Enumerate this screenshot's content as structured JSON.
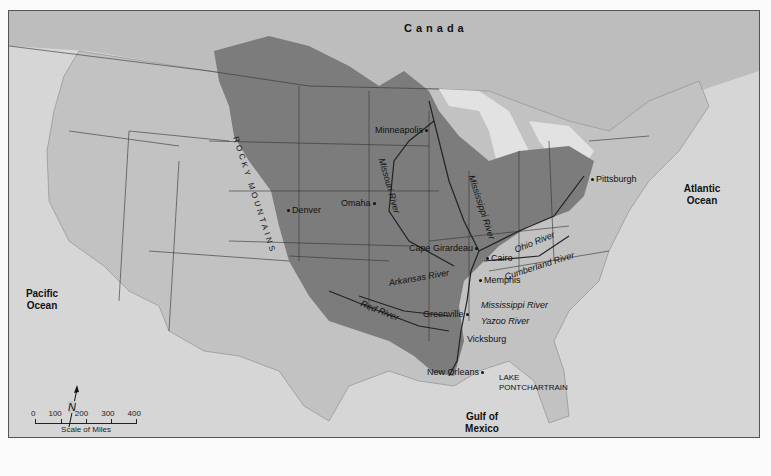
{
  "map": {
    "title_labels": {
      "country": "Canada",
      "oceans": {
        "pacific": "Pacific Ocean",
        "atlantic": "Atlantic Ocean",
        "gulf": "Gulf of Mexico"
      },
      "mountains": "ROCKY MOUNTAINS"
    },
    "cities": [
      {
        "name": "Minneapolis"
      },
      {
        "name": "Omaha"
      },
      {
        "name": "Denver"
      },
      {
        "name": "Pittsburgh"
      },
      {
        "name": "Cape Girardeau"
      },
      {
        "name": "Cairo"
      },
      {
        "name": "Memphis"
      },
      {
        "name": "Greenville"
      },
      {
        "name": "Vicksburg"
      },
      {
        "name": "New Orleans"
      }
    ],
    "rivers": [
      {
        "name": "Missouri River"
      },
      {
        "name": "Mississippi River"
      },
      {
        "name": "Ohio River"
      },
      {
        "name": "Cumberland River"
      },
      {
        "name": "Arkansas River"
      },
      {
        "name": "Red River"
      },
      {
        "name": "Mississippi River"
      },
      {
        "name": "Yazoo River"
      }
    ],
    "lake": {
      "line1": "LAKE",
      "line2": "PONTCHARTRAIN"
    },
    "scale": {
      "ticks": [
        "0",
        "100",
        "200",
        "300",
        "400"
      ],
      "caption": "Scale of Miles"
    },
    "north_arrow": "N",
    "colors": {
      "land": "#c9c9c9",
      "ocean": "#d6d6d6",
      "basin": "#7c7c7c",
      "lakes": "#e2e2e2",
      "borders": "#333333"
    }
  }
}
